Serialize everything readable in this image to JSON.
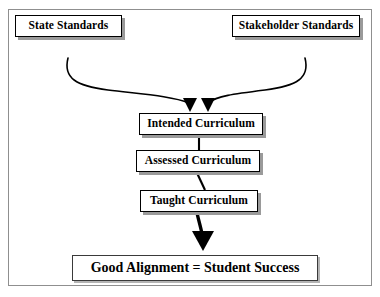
{
  "diagram": {
    "background_color": "#ffffff",
    "frame_color": "#8f8f8f",
    "stroke_color": "#000000",
    "shadow_color": "#9a9a9a",
    "nodes": {
      "state_standards": "State Standards",
      "stakeholder_standards": "Stakeholder Standards",
      "intended_curriculum": "Intended Curriculum",
      "assessed_curriculum": "Assessed Curriculum",
      "taught_curriculum": "Taught Curriculum",
      "outcome": "Good Alignment = Student Success"
    },
    "connectors": [
      {
        "name": "state-standards-to-intended-curriculum",
        "from": "state_standards",
        "to": "intended_curriculum",
        "style": "s-curve",
        "arrowhead": true
      },
      {
        "name": "stakeholder-standards-to-intended-curriculum",
        "from": "stakeholder_standards",
        "to": "intended_curriculum",
        "style": "s-curve-mirrored",
        "arrowhead": true
      },
      {
        "name": "intended-to-assessed-curriculum",
        "from": "intended_curriculum",
        "to": "assessed_curriculum",
        "style": "straight",
        "arrowhead": false
      },
      {
        "name": "assessed-to-taught-curriculum",
        "from": "assessed_curriculum",
        "to": "taught_curriculum",
        "style": "slanted",
        "arrowhead": false
      },
      {
        "name": "taught-curriculum-to-outcome",
        "from": "taught_curriculum",
        "to": "outcome",
        "style": "thick-tapered",
        "arrowhead": true
      }
    ]
  }
}
